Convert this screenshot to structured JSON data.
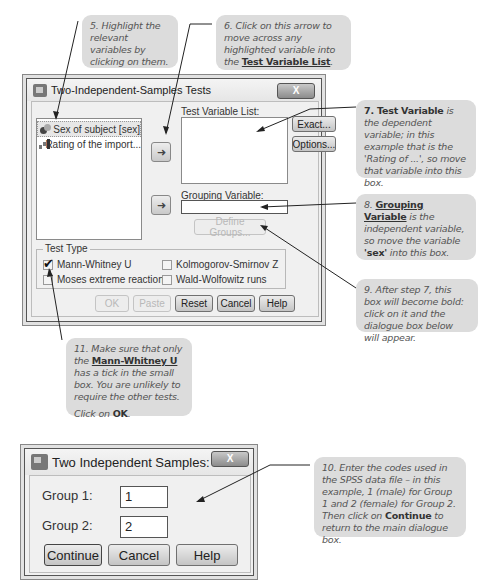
{
  "annotations": {
    "step5": "5. Highlight the relevant variables by clicking on them.",
    "step6_pre": "6. Click on this arrow to move across any highlighted variable into the ",
    "step6_bold": "Test Variable List",
    "step6_post": ".",
    "step7_bold": "7. Test Variable",
    "step7_rest": " is the dependent variable; in this example that is the 'Rating of ...', so move that variable into this box.",
    "step8_num": "8. ",
    "step8_bold": "Grouping Variable",
    "step8_mid": " is the independent variable, so move the variable ",
    "step8_sex": "'sex'",
    "step8_post": " into this box.",
    "step9": "9. After step 7, this box will become bold: click on it and the dialogue box below will appear.",
    "step10_a": "10. Enter the codes used in the SPSS data file – in this example, 1 (male) for Group 1 and 2 (female) for Group 2. Then click on ",
    "step10_bold": "Continue",
    "step10_b": " to return to the main dialogue box.",
    "step11_a": "11. Make sure that only the ",
    "step11_bold": "Mann-Whitney U",
    "step11_b": " has a tick in the small box. You are unlikely to require the other tests.",
    "step11_click": "Click on ",
    "step11_ok": "OK",
    "step11_end": "."
  },
  "main_dialog": {
    "title": "Two-Independent-Samples Tests",
    "close_label": "X",
    "variables": [
      {
        "label": "Sex of subject [sex]",
        "type": "nominal",
        "selected": true
      },
      {
        "label": "Rating of the import...",
        "type": "scale",
        "selected": false
      }
    ],
    "move_arrow_glyph": "➜",
    "test_variable_list_label": "Test Variable List:",
    "grouping_variable_label": "Grouping Variable:",
    "define_groups_label": "Define Groups...",
    "exact_label": "Exact...",
    "options_label": "Options...",
    "test_type": {
      "title": "Test Type",
      "options": [
        {
          "label": "Mann-Whitney U",
          "checked": true
        },
        {
          "label": "Kolmogorov-Smirnov Z",
          "checked": false
        },
        {
          "label": "Moses extreme reactions",
          "checked": false
        },
        {
          "label": "Wald-Wolfowitz runs",
          "checked": false
        }
      ]
    },
    "buttons": {
      "ok": "OK",
      "paste": "Paste",
      "reset": "Reset",
      "cancel": "Cancel",
      "help": "Help"
    }
  },
  "groups_dialog": {
    "title": "Two Independent Samples: ...",
    "close_label": "X",
    "group1_label": "Group 1:",
    "group1_value": "1",
    "group2_label": "Group 2:",
    "group2_value": "2",
    "buttons": {
      "continue": "Continue",
      "cancel": "Cancel",
      "help": "Help"
    }
  }
}
